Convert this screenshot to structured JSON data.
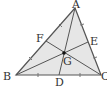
{
  "diagram": {
    "title": "",
    "points": {
      "A": {
        "label": "A",
        "x": 75,
        "y": 8
      },
      "B": {
        "label": "B",
        "x": 16,
        "y": 75
      },
      "C": {
        "label": "C",
        "x": 101,
        "y": 75
      },
      "D": {
        "label": "D",
        "x": 59,
        "y": 75
      },
      "E": {
        "label": "E",
        "x": 88,
        "y": 42
      },
      "F": {
        "label": "F",
        "x": 46,
        "y": 41
      },
      "G": {
        "label": "G",
        "x": 64,
        "y": 53
      }
    },
    "colors": {
      "fill": "#e6e6e6",
      "stroke": "#555555",
      "label": "#333333",
      "centroid": "#111111"
    }
  }
}
